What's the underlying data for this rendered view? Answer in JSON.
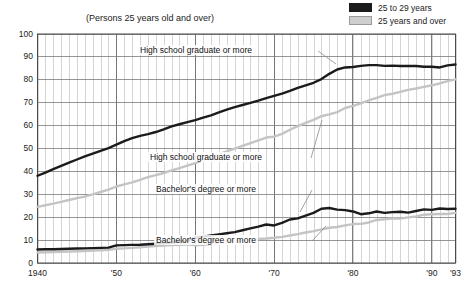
{
  "subtitle": "(Persons 25 years old and over)",
  "legend": {
    "items": [
      {
        "label": "25 to 29 years",
        "color": "#1b1b1b",
        "swatch": "dark"
      },
      {
        "label": "25 years and over",
        "color": "#cfcfcf",
        "swatch": "light"
      }
    ]
  },
  "annotations": [
    {
      "id": "hs-25to29",
      "text": "High school graduate or more",
      "x": 196,
      "y": 50
    },
    {
      "id": "hs-25over",
      "text": "High school graduate or more",
      "x": 206,
      "y": 157
    },
    {
      "id": "ba-25to29",
      "text": "Bachelor's degree or more",
      "x": 206,
      "y": 189
    },
    {
      "id": "ba-25over",
      "text": "Bachelor's degree or more",
      "x": 206,
      "y": 240
    }
  ],
  "chart_data": {
    "type": "line",
    "title": "",
    "subtitle": "(Persons 25 years old and over)",
    "xlabel": "",
    "ylabel": "",
    "xlim": [
      1940,
      1993
    ],
    "ylim": [
      0,
      100
    ],
    "ytick_values": [
      0,
      10,
      20,
      30,
      40,
      50,
      60,
      70,
      80,
      90,
      100
    ],
    "ytick_labels": [
      "0",
      "10",
      "20",
      "30",
      "40",
      "50",
      "60",
      "70",
      "80",
      "90",
      "100"
    ],
    "xtick_values": [
      1940,
      1950,
      1960,
      1970,
      1980,
      1990,
      1993
    ],
    "xtick_labels": [
      "1940",
      "'50",
      "'60",
      "'70",
      "'80",
      "'90",
      "'93"
    ],
    "grid": "both-minor-yearly",
    "legend_position": "top-right",
    "x": [
      1940,
      1941,
      1942,
      1943,
      1944,
      1945,
      1946,
      1947,
      1948,
      1949,
      1950,
      1951,
      1952,
      1953,
      1954,
      1955,
      1956,
      1957,
      1958,
      1959,
      1960,
      1961,
      1962,
      1963,
      1964,
      1965,
      1966,
      1967,
      1968,
      1969,
      1970,
      1971,
      1972,
      1973,
      1974,
      1975,
      1976,
      1977,
      1978,
      1979,
      1980,
      1981,
      1982,
      1983,
      1984,
      1985,
      1986,
      1987,
      1988,
      1989,
      1990,
      1991,
      1992,
      1993
    ],
    "series": [
      {
        "name": "High school graduate or more, 25 to 29 years",
        "color": "#1b1b1b",
        "width": 2.4,
        "values": [
          38.1,
          39.5,
          41.0,
          42.4,
          43.8,
          45.2,
          46.6,
          47.8,
          49.0,
          50.2,
          51.7,
          53.2,
          54.5,
          55.5,
          56.3,
          57.2,
          58.4,
          59.7,
          60.6,
          61.5,
          62.4,
          63.5,
          64.5,
          65.8,
          67.0,
          68.1,
          69.0,
          69.9,
          70.9,
          72.0,
          73.0,
          74.0,
          75.2,
          76.5,
          77.6,
          78.7,
          80.3,
          82.6,
          84.5,
          85.4,
          85.6,
          86.1,
          86.4,
          86.4,
          86.1,
          86.2,
          86.0,
          86.1,
          86.0,
          85.7,
          85.7,
          85.4,
          86.3,
          86.7
        ]
      },
      {
        "name": "High school graduate or more, 25 years and over",
        "color": "#c4c4c4",
        "width": 2.4,
        "values": [
          24.5,
          25.2,
          25.9,
          26.7,
          27.5,
          28.3,
          29.0,
          30.0,
          31.0,
          32.0,
          33.4,
          34.3,
          35.2,
          36.3,
          37.5,
          38.4,
          39.3,
          40.4,
          41.4,
          42.5,
          43.6,
          45.0,
          46.3,
          47.5,
          48.8,
          49.9,
          51.1,
          52.3,
          53.5,
          54.8,
          55.2,
          56.4,
          58.2,
          59.8,
          61.2,
          62.5,
          64.1,
          64.9,
          65.9,
          67.7,
          68.6,
          69.7,
          71.0,
          72.1,
          73.3,
          73.9,
          74.7,
          75.6,
          76.2,
          76.9,
          77.6,
          78.4,
          79.4,
          80.2
        ]
      },
      {
        "name": "Bachelor's degree or more, 25 to 29 years",
        "color": "#1b1b1b",
        "width": 2.4,
        "values": [
          5.9,
          6.0,
          6.0,
          6.1,
          6.2,
          6.3,
          6.4,
          6.5,
          6.6,
          6.7,
          7.7,
          7.8,
          7.9,
          8.0,
          8.2,
          8.4,
          8.6,
          8.9,
          9.3,
          9.7,
          11.0,
          11.5,
          12.0,
          12.5,
          13.0,
          13.5,
          14.3,
          15.1,
          15.9,
          16.8,
          16.4,
          17.5,
          19.0,
          19.5,
          20.7,
          21.9,
          23.7,
          24.0,
          23.3,
          23.1,
          22.5,
          21.3,
          21.7,
          22.5,
          21.9,
          22.2,
          22.4,
          22.0,
          22.7,
          23.4,
          23.2,
          23.8,
          23.6,
          23.7
        ]
      },
      {
        "name": "Bachelor's degree or more, 25 years and over",
        "color": "#c4c4c4",
        "width": 2.4,
        "values": [
          4.6,
          4.7,
          4.8,
          4.9,
          5.0,
          5.1,
          5.2,
          5.4,
          5.6,
          5.8,
          6.2,
          6.4,
          6.6,
          6.9,
          7.2,
          7.4,
          7.6,
          7.8,
          8.0,
          8.2,
          7.7,
          8.0,
          8.3,
          8.6,
          9.1,
          9.4,
          9.8,
          10.1,
          10.5,
          10.7,
          11.0,
          11.4,
          12.0,
          12.6,
          13.3,
          13.9,
          14.7,
          15.4,
          15.7,
          16.4,
          17.0,
          17.1,
          17.7,
          18.8,
          19.1,
          19.4,
          19.4,
          19.9,
          20.3,
          21.1,
          21.3,
          21.4,
          21.4,
          21.9
        ]
      }
    ],
    "peak_annotations": []
  }
}
